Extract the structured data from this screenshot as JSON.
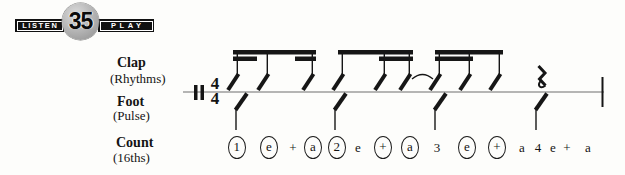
{
  "badge": {
    "listen": "LISTEN",
    "number": "35",
    "play": "PLAY"
  },
  "parts": {
    "clap": {
      "label": "Clap",
      "sub": "(Rhythms)"
    },
    "foot": {
      "label": "Foot",
      "sub": "(Pulse)"
    },
    "count": {
      "label": "Count",
      "sub": "(16ths)"
    }
  },
  "time_signature": {
    "top": "4",
    "bottom": "4"
  },
  "counts": [
    {
      "text": "1",
      "circled": true,
      "x": 237
    },
    {
      "text": "e",
      "circled": true,
      "x": 269
    },
    {
      "text": "+",
      "circled": false,
      "x": 293
    },
    {
      "text": "a",
      "circled": true,
      "x": 313
    },
    {
      "text": "2",
      "circled": true,
      "x": 337
    },
    {
      "text": "e",
      "circled": false,
      "x": 358
    },
    {
      "text": "+",
      "circled": true,
      "x": 383
    },
    {
      "text": "a",
      "circled": true,
      "x": 410
    },
    {
      "text": "3",
      "circled": false,
      "x": 437
    },
    {
      "text": "e",
      "circled": true,
      "x": 467
    },
    {
      "text": "+",
      "circled": true,
      "x": 497
    },
    {
      "text": "a",
      "circled": false,
      "x": 522
    },
    {
      "text": "4",
      "circled": false,
      "x": 538
    },
    {
      "text": "e",
      "circled": false,
      "x": 553
    },
    {
      "text": "+",
      "circled": false,
      "x": 567
    },
    {
      "text": "a",
      "circled": false,
      "x": 588
    }
  ],
  "notation": {
    "staff_line": {
      "x1": 183,
      "x2": 604,
      "y": 92
    },
    "begin_double_bar": {
      "bars": [
        194,
        200.5
      ],
      "y1": 85,
      "y2": 100,
      "bar_width": 3.5
    },
    "final_barline": {
      "x": 601.5,
      "y1": 77,
      "y2": 107,
      "width": 2
    },
    "clap_note_stems_x": [
      238,
      268,
      313,
      343,
      385,
      410,
      440,
      470,
      500
    ],
    "beams": [
      {
        "x1": 233,
        "x2": 316,
        "y": 50
      },
      {
        "x1": 233,
        "x2": 257,
        "y": 56.5
      },
      {
        "x1": 295,
        "x2": 316,
        "y": 56.5
      },
      {
        "x1": 338,
        "x2": 413,
        "y": 50
      },
      {
        "x1": 379,
        "x2": 413,
        "y": 56.5
      },
      {
        "x1": 435,
        "x2": 503,
        "y": 50
      },
      {
        "x1": 435,
        "x2": 473,
        "y": 56.5
      }
    ],
    "beam_thickness": 4.5,
    "tie": {
      "x1": 412,
      "x2": 433,
      "end_y": 79,
      "peak_y": 70
    },
    "quarter_rest": {
      "x": 542,
      "y_top": 66,
      "y_bottom": 88
    },
    "foot_note_stems_x": [
      236,
      335,
      435,
      536
    ],
    "foot_stem_bottom_y": 130
  },
  "colors": {
    "ink": "#161616",
    "staff_line": "#6e6e6e",
    "badge_black": "#111111",
    "circle_gray": "#b0b0b0",
    "background": "#fdfdfb"
  }
}
